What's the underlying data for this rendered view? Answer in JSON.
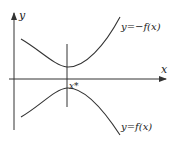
{
  "diagram": {
    "axes": {
      "x_label": "x",
      "y_label": "y"
    },
    "curves": [
      {
        "name": "upper",
        "label": "y=−f(x)"
      },
      {
        "name": "lower",
        "label": "y=f(x)"
      }
    ],
    "marker": {
      "label": "x*"
    },
    "colors": {
      "stroke": "#333333",
      "background": "#ffffff"
    }
  }
}
